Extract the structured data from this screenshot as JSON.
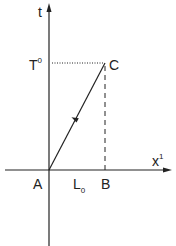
{
  "diagram": {
    "type": "spacetime-diagram",
    "axes": {
      "vertical": {
        "label": "t"
      },
      "horizontal": {
        "label": "x",
        "superscript": "1"
      }
    },
    "points": {
      "A": "A",
      "B": "B",
      "C": "C"
    },
    "time_marker": {
      "label": "T",
      "superscript": "0"
    },
    "length_label": {
      "label": "L",
      "subscript": "0"
    },
    "colors": {
      "ink": "#222222",
      "background": "#ffffff"
    }
  }
}
